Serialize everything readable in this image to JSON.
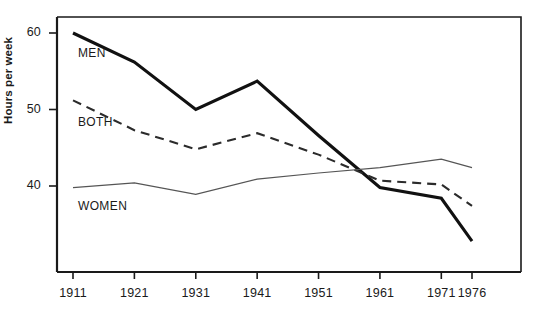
{
  "chart_data": {
    "type": "line",
    "title": "",
    "subtitle": "",
    "xlabel": "",
    "ylabel": "Hours per week",
    "x": [
      1911,
      1921,
      1931,
      1941,
      1951,
      1961,
      1971,
      1976
    ],
    "xtick_labels": [
      "1911",
      "1921",
      "1931",
      "1941",
      "1951",
      "1961",
      "1971",
      "1976"
    ],
    "ytick_labels": [
      "60",
      "50",
      "40"
    ],
    "yticks": [
      60,
      50,
      40
    ],
    "ylim": [
      30,
      62
    ],
    "xlim": [
      1906,
      1981
    ],
    "grid": false,
    "legend_position": "inline-annotations",
    "series": [
      {
        "name": "MEN",
        "label": "MEN",
        "style": "solid-thick",
        "color": "#111111",
        "values": [
          60.0,
          56.2,
          50.0,
          53.7,
          46.6,
          39.8,
          38.4,
          32.8
        ]
      },
      {
        "name": "BOTH",
        "label": "BOTH",
        "style": "dashed",
        "color": "#2b2b2b",
        "values": [
          51.2,
          47.3,
          44.8,
          46.9,
          44.1,
          40.7,
          40.2,
          37.4
        ]
      },
      {
        "name": "WOMEN",
        "label": "WOMEN",
        "style": "solid-thin",
        "color": "#555555",
        "values": [
          39.8,
          40.4,
          38.9,
          40.9,
          41.7,
          42.4,
          43.5,
          42.4
        ]
      }
    ],
    "annotations": [
      {
        "text": "MEN",
        "x": 1911.8,
        "y": 57.2
      },
      {
        "text": "BOTH",
        "x": 1911.8,
        "y": 48.3
      },
      {
        "text": "WOMEN",
        "x": 1911.8,
        "y": 37.2
      }
    ]
  },
  "axis": {
    "y_label": "Hours per week"
  }
}
